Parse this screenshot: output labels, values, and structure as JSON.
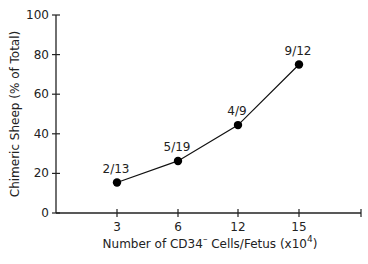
{
  "chart_data": {
    "type": "line",
    "title": "",
    "xlabel": "Number of CD34⁻ Cells/Fetus (x10⁴)",
    "xlabel_parts": {
      "main": "Number of CD34",
      "sup1": "–",
      "mid": " Cells/Fetus (x10",
      "sup2": "4",
      "end": ")"
    },
    "ylabel": "Chimeric Sheep (% of Total)",
    "categories": [
      "3",
      "6",
      "12",
      "15"
    ],
    "values": [
      15.4,
      26.3,
      44.4,
      75.0
    ],
    "point_labels": [
      "2/13",
      "5/19",
      "4/9",
      "9/12"
    ],
    "ylim": [
      0,
      100
    ],
    "yticks": [
      0,
      20,
      40,
      60,
      80,
      100
    ],
    "ytick_labels": [
      "0",
      "20",
      "40",
      "60",
      "80",
      "100"
    ],
    "grid": false,
    "legend": null,
    "marker": "filled-circle",
    "color": "#000000"
  }
}
